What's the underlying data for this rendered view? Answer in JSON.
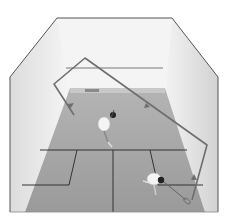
{
  "image": {
    "subject": "Overhead view of squash court with two players and ball trajectory",
    "width": 229,
    "height": 221
  },
  "colors": {
    "background": "#ffffff",
    "wall_light": "#f2f2f2",
    "wall_shade": "#d9d9d9",
    "floor": "#a8a8a8",
    "floor_dark": "#8c8c8c",
    "outline": "#555555",
    "court_lines": "#333333",
    "trajectory": "#6e6e6e",
    "player_shirt": "#f4f4f4",
    "player_hair": "#222222"
  },
  "court": {
    "outline_points": "10,77 57,18 172,18 218,77 218,212 10,212",
    "back_wall": "57,18 172,18 165,88 70,88",
    "left_wall": "10,77 57,18 70,88 25,212 10,212",
    "right_wall": "172,18 218,77 218,212 205,212 165,88",
    "floor": "70,88 165,88 205,212 25,212",
    "tin": "70,88 165,88 165,93 70,93",
    "service_line_y": 150,
    "center_line": {
      "x1": 113,
      "y1": 150,
      "x2": 113,
      "y2": 212
    },
    "left_box": "40,150 77,150 69,185 22,185",
    "right_box": "150,150 187,150 203,185 158,185",
    "front_wall_line": {
      "x1": 66,
      "y1": 68,
      "x2": 163,
      "y2": 68
    }
  },
  "trajectory": {
    "points": "74,115 54,84 85,58 207,145 192,200"
  },
  "players": [
    {
      "name": "player-front",
      "cx": 108,
      "cy": 122
    },
    {
      "name": "player-back",
      "cx": 157,
      "cy": 180
    }
  ]
}
